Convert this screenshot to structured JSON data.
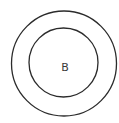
{
  "diagram": {
    "type": "concentric-circles",
    "stroke_color": "#2b2b2b",
    "outer_circle": {
      "cx": 64,
      "cy": 63.5,
      "r": 52.5,
      "stroke_width": 1.3
    },
    "inner_circle": {
      "cx": 63.5,
      "cy": 62.5,
      "r": 34.5,
      "stroke_width": 1.3
    },
    "center_label": "B",
    "label_color": "#3a3a3a"
  }
}
